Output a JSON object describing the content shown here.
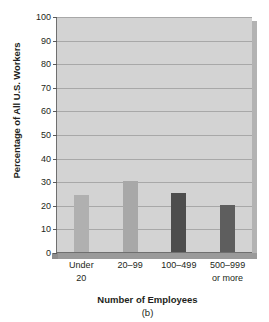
{
  "chart_data": {
    "type": "bar",
    "title": "",
    "caption": "(b)",
    "xlabel": "Number of Employees",
    "ylabel": "Percentage of All U.S. Workers",
    "categories": [
      "Under 20",
      "20–99",
      "100–499",
      "500–999 or more"
    ],
    "category_lines": [
      [
        "Under",
        "20"
      ],
      [
        "20–99",
        ""
      ],
      [
        "100–499",
        ""
      ],
      [
        "500–999",
        "or more"
      ]
    ],
    "values": [
      24,
      30,
      25,
      20
    ],
    "bar_colors": [
      "#b0b0b0",
      "#a8a8a8",
      "#4d4d4d",
      "#5e5e5e"
    ],
    "ylim": [
      0,
      100
    ],
    "ytick_step": 10,
    "ytick_labels": [
      "0",
      "10",
      "20",
      "30",
      "40",
      "50",
      "60",
      "70",
      "80",
      "90",
      "100"
    ],
    "grid": true,
    "grid_axis": "y",
    "legend": "none",
    "plot_background": "#d3d3d3",
    "gridline_color": "#a8a8a8",
    "axis_color": "#6f6f6f"
  }
}
